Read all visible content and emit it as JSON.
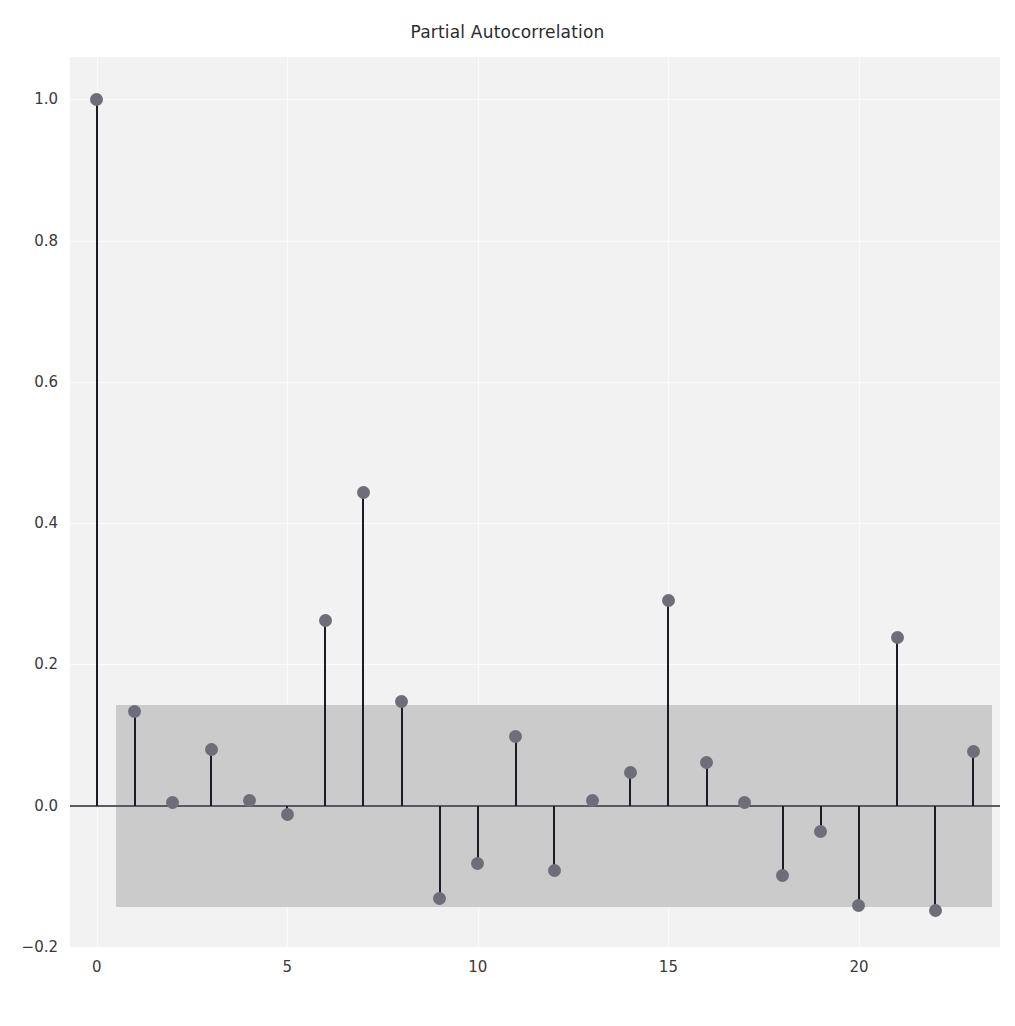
{
  "chart_data": {
    "type": "bar",
    "title": "Partial Autocorrelation",
    "xlabel": "",
    "ylabel": "",
    "xlim": [
      -0.7,
      23.7
    ],
    "ylim": [
      -0.2,
      1.06
    ],
    "grid": true,
    "legend": null,
    "x_ticks": [
      "0",
      "5",
      "10",
      "15",
      "20"
    ],
    "x_tick_values": [
      0,
      5,
      10,
      15,
      20
    ],
    "y_ticks": [
      "-0.2",
      "0.0",
      "0.2",
      "0.4",
      "0.6",
      "0.8",
      "1.0"
    ],
    "y_tick_values": [
      -0.2,
      0.0,
      0.2,
      0.4,
      0.6,
      0.8,
      1.0
    ],
    "categories": [
      0,
      1,
      2,
      3,
      4,
      5,
      6,
      7,
      8,
      9,
      10,
      11,
      12,
      13,
      14,
      15,
      16,
      17,
      18,
      19,
      20,
      21,
      22,
      23
    ],
    "values": [
      1.0,
      0.133,
      0.005,
      0.079,
      0.008,
      -0.013,
      0.262,
      0.444,
      0.148,
      -0.131,
      -0.082,
      0.098,
      -0.092,
      0.007,
      0.047,
      0.29,
      0.061,
      0.005,
      -0.099,
      -0.036,
      -0.141,
      0.238,
      -0.149,
      0.077
    ],
    "confidence_band": {
      "label": "95% confidence interval",
      "upper": 0.142,
      "lower": -0.144,
      "x_start": 0.5,
      "x_end": 23.5,
      "color": "#c8c8c8"
    },
    "style": {
      "plot_background": "#f2f2f2",
      "figure_background": "#ffffff",
      "stem_color": "#1c1c24",
      "marker_color": "#6e6e78",
      "zero_line_color": "#5a5a66",
      "gridline_color": "#fbfbfb",
      "text_color": "#3a3a3a"
    }
  }
}
